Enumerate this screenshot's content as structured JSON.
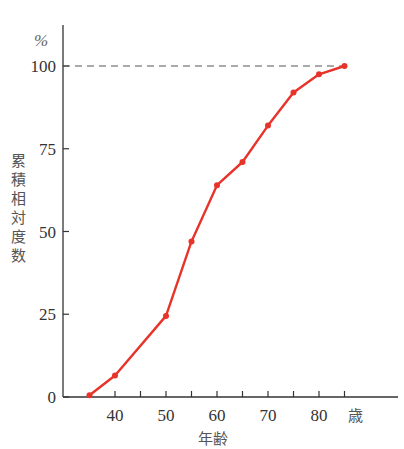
{
  "chart_data": {
    "type": "line",
    "title": "",
    "xlabel": "年齢",
    "x_unit": "歳",
    "ylabel": "累積相対度数",
    "y_unit": "%",
    "x": [
      35,
      40,
      50,
      55,
      60,
      65,
      70,
      75,
      80,
      85
    ],
    "series": [
      {
        "name": "累積相対度数",
        "values": [
          0.5,
          6.5,
          24.5,
          47,
          64,
          71,
          82,
          92,
          97.5,
          100
        ],
        "color": "#e8332a"
      }
    ],
    "xlim": [
      25,
      92
    ],
    "ylim": [
      0,
      100
    ],
    "x_ticks": [
      40,
      45,
      50,
      55,
      60,
      65,
      70,
      75,
      80,
      85
    ],
    "x_tick_labels": [
      "40",
      "50",
      "60",
      "70",
      "80"
    ],
    "y_ticks": [
      0,
      25,
      50,
      75,
      100
    ],
    "y_tick_labels": [
      "0",
      "25",
      "50",
      "75",
      "100"
    ],
    "reference_line": {
      "y": 100,
      "style": "dashed",
      "color": "#555555"
    },
    "grid": false,
    "legend": "none"
  },
  "labels": {
    "y_unit": "%",
    "x_unit": "歳",
    "x_title": "年齢",
    "y_title_chars": [
      "累",
      "積",
      "相",
      "対",
      "度",
      "数"
    ]
  }
}
